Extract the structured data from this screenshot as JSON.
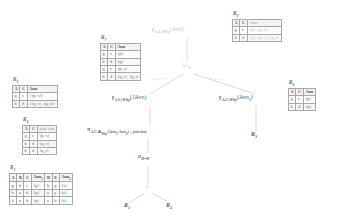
{
  "diagram": {
    "edge_color": "#c9c9c9",
    "text_color": "#5f5f5f",
    "faint_color": "#c8c8c8"
  },
  "nodes": {
    "root_label": "γ",
    "root_sub": "A,C;Why",
    "root_arg": "(Ann)",
    "union_symbol": "∪",
    "union_sub": "⊕",
    "gamma_left_label": "γ",
    "gamma_left_sub": "A,C;Why",
    "gamma_left_arg": "(JAnn)",
    "gamma_right_label": "γ",
    "gamma_right_sub": "A,C;Why",
    "gamma_right_arg": "(Ann",
    "gamma_right_arg_sub": "3",
    "gamma_right_arg_end": ")",
    "pi_label": "π",
    "pi_sub": "A,C,⊞",
    "pi_sub_sub": "Why",
    "pi_sub_args": "(Ann",
    "pi_sub_args2": "1",
    "pi_sub_args3": ",Ann",
    "pi_sub_args4": "2",
    "pi_sub_args5": ")→joinAnn",
    "sigma_label": "σ",
    "sigma_sub": "B=D",
    "cross_symbol": "×",
    "leaf_r1": "R",
    "leaf_r1_sub": "1",
    "leaf_r2": "R",
    "leaf_r2_sub": "2",
    "leaf_r3": "R",
    "leaf_r3_sub": "3"
  },
  "tables": {
    "r8": {
      "caption": "R",
      "caption_sub": "8",
      "headers": [
        "A",
        "C",
        "Ann"
      ],
      "rows": [
        [
          "g",
          "c",
          "{p}, {p, s}"
        ],
        [
          "h",
          "d",
          "{q}, {q, r}, {q, t}"
        ]
      ]
    },
    "r7": {
      "caption": "R",
      "caption_sub": "7",
      "headers": [
        "A",
        "C",
        "Ann"
      ],
      "rows": [
        [
          "g",
          "c",
          "{p}"
        ],
        [
          "h",
          "d",
          "{q}"
        ],
        [
          "g",
          "c",
          "{p, s}"
        ],
        [
          "h",
          "d",
          "{q, r}, {q, t}"
        ]
      ]
    },
    "r6": {
      "caption": "R",
      "caption_sub": "6",
      "headers": [
        "A",
        "C",
        "Ann"
      ],
      "rows": [
        [
          "g",
          "c",
          "{p}"
        ],
        [
          "h",
          "d",
          "{q}"
        ]
      ]
    },
    "r5": {
      "caption": "R",
      "caption_sub": "5",
      "headers": [
        "A",
        "C",
        "Ann"
      ],
      "rows": [
        [
          "g",
          "c",
          "{{p, s}}"
        ],
        [
          "h",
          "d",
          "{{q, r}, {q, t}}"
        ]
      ]
    },
    "r4": {
      "caption": "R",
      "caption_sub": "4",
      "headers": [
        "A",
        "C",
        "joinAnn"
      ],
      "rows": [
        [
          "g",
          "c",
          "{p, s}"
        ],
        [
          "h",
          "d",
          "{q, r}"
        ],
        [
          "h",
          "d",
          "{q, t}"
        ]
      ]
    },
    "r3": {
      "caption": "R",
      "caption_sub": "3",
      "headers": [
        "A",
        "B",
        "C",
        "Ann",
        "D",
        "E",
        "Ann"
      ],
      "header_subs": [
        "",
        "",
        "",
        "1",
        "",
        "",
        "2"
      ],
      "rows": [
        [
          "g",
          "b",
          "c",
          "{p}",
          "b",
          "g",
          "{s}"
        ],
        [
          "h",
          "a",
          "d",
          "{q}",
          "a",
          "y",
          "{r}"
        ],
        [
          "h",
          "a",
          "d",
          "{q}",
          "a",
          "h",
          "{t}"
        ]
      ]
    }
  }
}
